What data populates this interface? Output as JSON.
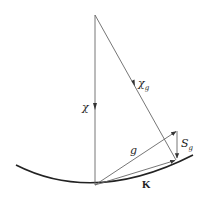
{
  "diagram": {
    "type": "ewald-sphere-construction",
    "colors": {
      "line": "#555555",
      "arc": "#222222",
      "text": "#222222"
    },
    "labels": {
      "chi": "χ",
      "chi_g_base": "χ",
      "chi_g_sub": "g",
      "g": "g",
      "s_g_base": "S",
      "s_g_sub": "g",
      "K": "K"
    },
    "points": {
      "center": [
        94,
        15
      ],
      "origin": [
        95,
        185
      ],
      "g_tip": [
        177,
        131
      ],
      "k_tip": [
        176,
        160
      ]
    }
  }
}
